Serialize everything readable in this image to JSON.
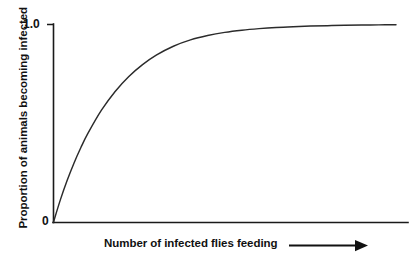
{
  "figure": {
    "background_color": "#ffffff",
    "width": 418,
    "height": 269,
    "axis_color": "#1a1a1a",
    "curve_color": "#2b2b2b"
  },
  "axes": {
    "y_title": "Proportion of animals becoming infected",
    "x_title": "Number of infected flies feeding",
    "x_arrow_icon": "right-arrow-icon",
    "y_tick_top": "1.0",
    "y_tick_bottom": "0"
  },
  "chart_data": {
    "type": "line",
    "title": "",
    "subtitle": "",
    "xlabel": "Number of infected flies feeding",
    "ylabel": "Proportion of animals becoming infected",
    "xlim": [
      0,
      1
    ],
    "ylim": [
      0,
      1.0
    ],
    "x_tick_labels": [],
    "y_tick_labels": [
      "0",
      "1.0"
    ],
    "grid": false,
    "legend": null,
    "annotations": [
      "Arrow on x-axis indicating increasing number of infected flies feeding"
    ],
    "series": [
      {
        "name": "Proportion infected",
        "x": [
          0.0,
          0.02,
          0.04,
          0.06,
          0.08,
          0.1,
          0.14,
          0.18,
          0.22,
          0.26,
          0.3,
          0.35,
          0.4,
          0.45,
          0.5,
          0.55,
          0.6,
          0.65,
          0.7,
          0.75,
          0.8,
          0.85,
          0.9,
          0.95,
          1.0
        ],
        "y": [
          0.0,
          0.112,
          0.211,
          0.299,
          0.377,
          0.447,
          0.566,
          0.661,
          0.737,
          0.797,
          0.845,
          0.89,
          0.922,
          0.944,
          0.96,
          0.971,
          0.979,
          0.985,
          0.989,
          0.992,
          0.994,
          0.996,
          0.997,
          0.998,
          0.999
        ]
      }
    ]
  }
}
